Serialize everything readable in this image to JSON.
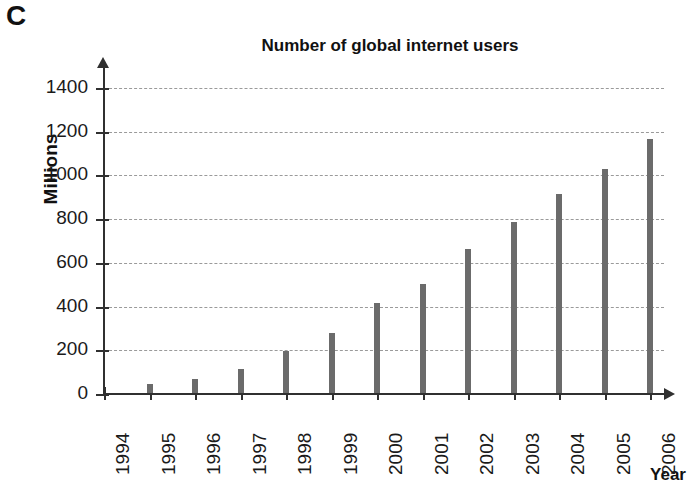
{
  "panel": {
    "letter": "C"
  },
  "chart_data": {
    "type": "bar",
    "title": "Number of global internet users",
    "xlabel": "Year",
    "ylabel": "Millions",
    "categories": [
      "1994",
      "1995",
      "1996",
      "1997",
      "1998",
      "1999",
      "2000",
      "2001",
      "2002",
      "2003",
      "2004",
      "2005",
      "2006"
    ],
    "values": [
      0,
      45,
      70,
      115,
      195,
      280,
      415,
      505,
      665,
      785,
      915,
      1030,
      1165
    ],
    "ylim": [
      0,
      1400
    ],
    "ytick_labels": [
      "0",
      "200",
      "400",
      "600",
      "800",
      "1000",
      "1200",
      "1400"
    ],
    "ytick_values": [
      0,
      200,
      400,
      600,
      800,
      1000,
      1200,
      1400
    ],
    "grid": true,
    "legend": "none",
    "bar_color": "#6b6b6b",
    "axis_color": "#303030",
    "grid_color": "#9a9a9a"
  }
}
